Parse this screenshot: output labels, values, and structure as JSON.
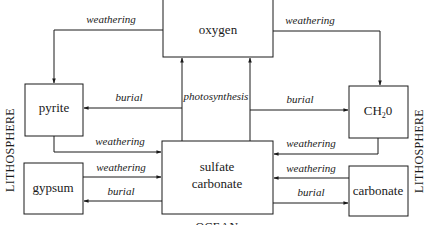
{
  "diagram": {
    "boxes": {
      "oxygen": "oxygen",
      "pyrite": "pyrite",
      "ch2o_main": "CH",
      "ch2o_sub": "2",
      "ch2o_tail": "0",
      "gypsum": "gypsum",
      "sulfate_line1": "sulfate",
      "sulfate_line2": "carbonate",
      "carbonate": "carbonate"
    },
    "flows": {
      "oxygen_to_pyrite": "weathering",
      "oxygen_to_ch2o": "weathering",
      "sulfate_to_pyrite": "burial",
      "sulfate_to_oxygen": "photosynthesis",
      "sulfate_to_ch2o": "burial",
      "pyrite_to_sulfate": "weathering",
      "ch2o_to_sulfate": "weathering",
      "gypsum_to_sulfate": "weathering",
      "sulfate_to_gypsum": "burial",
      "carbonate_to_sulfate": "weathering",
      "sulfate_to_carbonate": "burial"
    },
    "regions": {
      "left": "LITHOSPHERE",
      "right": "LITHOSPHERE",
      "bottom": "OCEAN"
    },
    "colors": {
      "line": "#1a1a1a",
      "background": "#ffffff"
    }
  }
}
